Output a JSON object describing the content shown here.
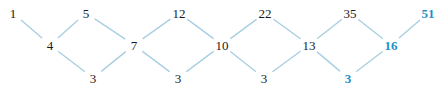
{
  "diagram": {
    "type": "zigzag-lattice-graph",
    "background_color": "#ffffff",
    "edge_color": "#a9cfe2",
    "node_color": "#1a1a1a",
    "highlight_color": "#1e90c8",
    "rows": {
      "top_label": "top",
      "middle_label": "middle",
      "bottom_label": "bottom"
    },
    "nodes": [
      {
        "id": "n0",
        "label": "1",
        "x": 13,
        "y": 13,
        "row": "top",
        "highlight": false
      },
      {
        "id": "n1",
        "label": "4",
        "x": 50,
        "y": 45,
        "row": "middle",
        "highlight": false
      },
      {
        "id": "n2",
        "label": "5",
        "x": 86,
        "y": 13,
        "row": "top",
        "highlight": false
      },
      {
        "id": "n3",
        "label": "3",
        "x": 93,
        "y": 78,
        "row": "bottom",
        "highlight": false
      },
      {
        "id": "n4",
        "label": "7",
        "x": 134,
        "y": 45,
        "row": "middle",
        "highlight": false
      },
      {
        "id": "n5",
        "label": "12",
        "x": 179,
        "y": 13,
        "row": "top",
        "highlight": false
      },
      {
        "id": "n6",
        "label": "3",
        "x": 178,
        "y": 78,
        "row": "bottom",
        "highlight": false
      },
      {
        "id": "n7",
        "label": "10",
        "x": 222,
        "y": 45,
        "row": "middle",
        "highlight": false
      },
      {
        "id": "n8",
        "label": "22",
        "x": 265,
        "y": 13,
        "row": "top",
        "highlight": false
      },
      {
        "id": "n9",
        "label": "3",
        "x": 264,
        "y": 78,
        "row": "bottom",
        "highlight": false
      },
      {
        "id": "n10",
        "label": "13",
        "x": 309,
        "y": 45,
        "row": "middle",
        "highlight": false
      },
      {
        "id": "n11",
        "label": "35",
        "x": 350,
        "y": 13,
        "row": "top",
        "highlight": false
      },
      {
        "id": "n12",
        "label": "3",
        "x": 348,
        "y": 78,
        "row": "bottom",
        "highlight": true
      },
      {
        "id": "n13",
        "label": "16",
        "x": 391,
        "y": 45,
        "row": "middle",
        "highlight": true
      },
      {
        "id": "n14",
        "label": "51",
        "x": 428,
        "y": 13,
        "row": "top",
        "highlight": true
      }
    ],
    "edges": [
      {
        "from": "n0",
        "to": "n1"
      },
      {
        "from": "n1",
        "to": "n2"
      },
      {
        "from": "n1",
        "to": "n3"
      },
      {
        "from": "n2",
        "to": "n4"
      },
      {
        "from": "n3",
        "to": "n4"
      },
      {
        "from": "n4",
        "to": "n5"
      },
      {
        "from": "n4",
        "to": "n6"
      },
      {
        "from": "n5",
        "to": "n7"
      },
      {
        "from": "n6",
        "to": "n7"
      },
      {
        "from": "n7",
        "to": "n8"
      },
      {
        "from": "n7",
        "to": "n9"
      },
      {
        "from": "n8",
        "to": "n10"
      },
      {
        "from": "n9",
        "to": "n10"
      },
      {
        "from": "n10",
        "to": "n11"
      },
      {
        "from": "n10",
        "to": "n12"
      },
      {
        "from": "n11",
        "to": "n13"
      },
      {
        "from": "n12",
        "to": "n13"
      },
      {
        "from": "n13",
        "to": "n14"
      }
    ]
  }
}
